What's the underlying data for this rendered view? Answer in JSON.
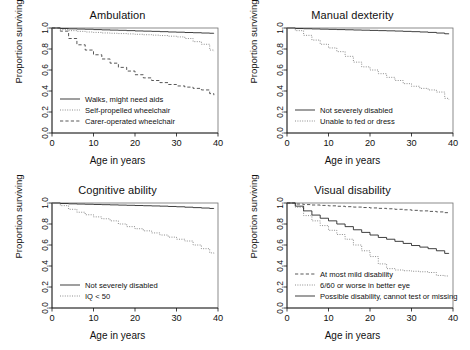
{
  "figure": {
    "axis_labels": {
      "x": "Age in years",
      "y": "Proportion surviving"
    },
    "x_ticks": [
      "0",
      "10",
      "20",
      "30",
      "40"
    ],
    "y_ticks": [
      "0.0",
      "0.2",
      "0.4",
      "0.6",
      "0.8",
      "1.0"
    ]
  },
  "chart_data": [
    {
      "type": "line",
      "title": "Ambulation",
      "xlabel": "Age in years",
      "ylabel": "Proportion surviving",
      "xlim": [
        0,
        40
      ],
      "ylim": [
        0,
        1
      ],
      "grid": false,
      "legend_position": "lower left",
      "x": [
        0,
        2,
        4,
        6,
        8,
        10,
        12,
        14,
        16,
        18,
        20,
        22,
        24,
        26,
        28,
        30,
        32,
        34,
        36,
        38,
        39
      ],
      "series": [
        {
          "name": "Walks, might need aids",
          "style": "solid",
          "values": [
            1.0,
            0.995,
            0.992,
            0.99,
            0.988,
            0.985,
            0.982,
            0.98,
            0.978,
            0.975,
            0.972,
            0.97,
            0.968,
            0.965,
            0.962,
            0.96,
            0.957,
            0.955,
            0.952,
            0.95,
            0.948
          ]
        },
        {
          "name": "Self-propelled wheelchair",
          "style": "dotted",
          "values": [
            1.0,
            0.985,
            0.975,
            0.968,
            0.962,
            0.958,
            0.953,
            0.95,
            0.947,
            0.944,
            0.94,
            0.936,
            0.932,
            0.928,
            0.922,
            0.915,
            0.9,
            0.87,
            0.845,
            0.79,
            0.78
          ]
        },
        {
          "name": "Carer-operated wheelchair",
          "style": "dashed",
          "values": [
            1.0,
            0.97,
            0.9,
            0.84,
            0.79,
            0.745,
            0.705,
            0.665,
            0.625,
            0.59,
            0.555,
            0.525,
            0.5,
            0.48,
            0.462,
            0.448,
            0.437,
            0.425,
            0.41,
            0.375,
            0.36
          ]
        }
      ]
    },
    {
      "type": "line",
      "title": "Manual dexterity",
      "xlabel": "Age in years",
      "ylabel": "Proportion surviving",
      "xlim": [
        0,
        40
      ],
      "ylim": [
        0,
        1
      ],
      "grid": false,
      "legend_position": "lower left",
      "x": [
        0,
        2,
        4,
        6,
        8,
        10,
        12,
        14,
        16,
        18,
        20,
        22,
        24,
        26,
        28,
        30,
        32,
        34,
        36,
        38,
        39
      ],
      "series": [
        {
          "name": "Not severely disabled",
          "style": "solid",
          "values": [
            1.0,
            0.995,
            0.993,
            0.991,
            0.989,
            0.987,
            0.985,
            0.983,
            0.981,
            0.979,
            0.977,
            0.975,
            0.973,
            0.971,
            0.968,
            0.965,
            0.962,
            0.958,
            0.952,
            0.945,
            0.942
          ]
        },
        {
          "name": "Unable to fed or dress",
          "style": "dotted",
          "values": [
            1.0,
            0.975,
            0.93,
            0.885,
            0.845,
            0.81,
            0.775,
            0.73,
            0.675,
            0.63,
            0.6,
            0.565,
            0.53,
            0.5,
            0.47,
            0.445,
            0.425,
            0.41,
            0.39,
            0.33,
            0.32
          ]
        }
      ]
    },
    {
      "type": "line",
      "title": "Cognitive ability",
      "xlabel": "Age in years",
      "ylabel": "Proportion surviving",
      "xlim": [
        0,
        40
      ],
      "ylim": [
        0,
        1
      ],
      "grid": false,
      "legend_position": "lower left",
      "x": [
        0,
        2,
        4,
        6,
        8,
        10,
        12,
        14,
        16,
        18,
        20,
        22,
        24,
        26,
        28,
        30,
        32,
        34,
        36,
        38,
        39
      ],
      "series": [
        {
          "name": "Not severely disabled",
          "style": "solid",
          "values": [
            1.0,
            0.995,
            0.992,
            0.99,
            0.988,
            0.986,
            0.984,
            0.982,
            0.98,
            0.978,
            0.976,
            0.974,
            0.972,
            0.97,
            0.967,
            0.964,
            0.96,
            0.956,
            0.952,
            0.948,
            0.946
          ]
        },
        {
          "name": "IQ < 50",
          "style": "dotted",
          "values": [
            1.0,
            0.975,
            0.94,
            0.912,
            0.888,
            0.868,
            0.85,
            0.83,
            0.8,
            0.775,
            0.755,
            0.735,
            0.715,
            0.695,
            0.675,
            0.655,
            0.638,
            0.6,
            0.565,
            0.525,
            0.52
          ]
        }
      ]
    },
    {
      "type": "line",
      "title": "Visual disability",
      "xlabel": "Age in years",
      "ylabel": "Proportion surviving",
      "xlim": [
        0,
        40
      ],
      "ylim": [
        0,
        1
      ],
      "grid": false,
      "legend_position": "lower left",
      "x": [
        0,
        2,
        4,
        6,
        8,
        10,
        12,
        14,
        16,
        18,
        20,
        22,
        24,
        26,
        28,
        30,
        32,
        34,
        36,
        38,
        39
      ],
      "series": [
        {
          "name": "At most mild disability",
          "style": "dashed",
          "values": [
            1.0,
            0.99,
            0.985,
            0.981,
            0.977,
            0.973,
            0.969,
            0.965,
            0.961,
            0.957,
            0.953,
            0.949,
            0.945,
            0.94,
            0.935,
            0.93,
            0.925,
            0.92,
            0.915,
            0.908,
            0.905
          ]
        },
        {
          "name": "6/60 or worse in better eye",
          "style": "dotted",
          "values": [
            1.0,
            0.96,
            0.88,
            0.83,
            0.785,
            0.74,
            0.7,
            0.655,
            0.6,
            0.545,
            0.49,
            0.42,
            0.375,
            0.362,
            0.355,
            0.35,
            0.345,
            0.338,
            0.31,
            0.305,
            0.302
          ]
        },
        {
          "name": "Possible disability, cannot test or missing",
          "style": "solid",
          "values": [
            1.0,
            0.97,
            0.925,
            0.885,
            0.855,
            0.83,
            0.8,
            0.775,
            0.745,
            0.72,
            0.695,
            0.672,
            0.655,
            0.635,
            0.615,
            0.595,
            0.58,
            0.565,
            0.545,
            0.52,
            0.518
          ]
        }
      ]
    }
  ]
}
